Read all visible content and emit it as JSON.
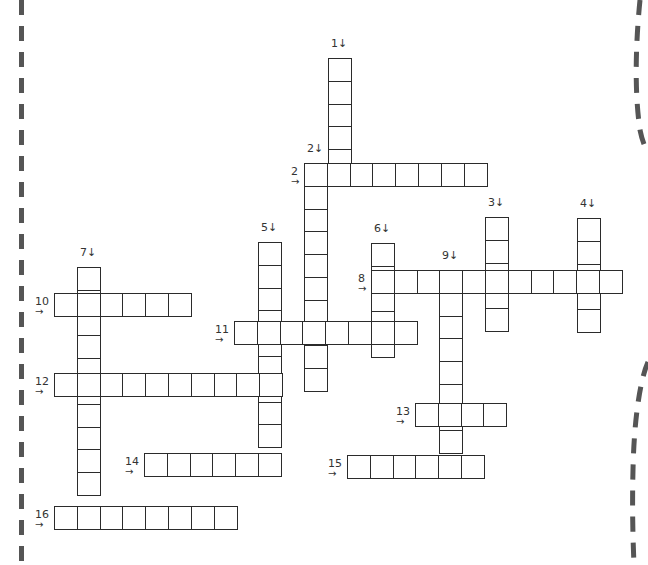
{
  "puzzle": {
    "cell_size": 22.8,
    "border_color": "#2b2b2b",
    "words": [
      {
        "num": "1",
        "dir": "down",
        "x": 328,
        "y": 58,
        "len": 5,
        "label": "1↓"
      },
      {
        "num": "2",
        "dir": "across",
        "x": 304,
        "y": 163,
        "len": 8,
        "label": "2",
        "arrow": "→"
      },
      {
        "num": "2",
        "dir": "down",
        "x": 304,
        "y": 163,
        "len": 10,
        "label": "2↓"
      },
      {
        "num": "3",
        "dir": "down",
        "x": 485,
        "y": 217,
        "len": 5,
        "label": "3↓"
      },
      {
        "num": "4",
        "dir": "down",
        "x": 577,
        "y": 218,
        "len": 5,
        "label": "4↓"
      },
      {
        "num": "5",
        "dir": "down",
        "x": 258,
        "y": 242,
        "len": 9,
        "label": "5↓"
      },
      {
        "num": "6",
        "dir": "down",
        "x": 371,
        "y": 243,
        "len": 5,
        "label": "6↓"
      },
      {
        "num": "7",
        "dir": "down",
        "x": 77,
        "y": 267,
        "len": 10,
        "label": "7↓"
      },
      {
        "num": "8",
        "dir": "across",
        "x": 371,
        "y": 270,
        "len": 11,
        "label": "8",
        "arrow": "→"
      },
      {
        "num": "9",
        "dir": "down",
        "x": 439,
        "y": 270,
        "len": 8,
        "label": "9↓"
      },
      {
        "num": "10",
        "dir": "across",
        "x": 54,
        "y": 293,
        "len": 6,
        "label": "10",
        "arrow": "→"
      },
      {
        "num": "11",
        "dir": "across",
        "x": 234,
        "y": 321,
        "len": 8,
        "label": "11",
        "arrow": "→"
      },
      {
        "num": "12",
        "dir": "across",
        "x": 54,
        "y": 373,
        "len": 10,
        "label": "12",
        "arrow": "→"
      },
      {
        "num": "13",
        "dir": "across",
        "x": 415,
        "y": 403,
        "len": 4,
        "label": "13",
        "arrow": "→"
      },
      {
        "num": "14",
        "dir": "across",
        "x": 144,
        "y": 453,
        "len": 6,
        "label": "14",
        "arrow": "→"
      },
      {
        "num": "15",
        "dir": "across",
        "x": 347,
        "y": 455,
        "len": 6,
        "label": "15",
        "arrow": "→"
      },
      {
        "num": "16",
        "dir": "across",
        "x": 54,
        "y": 506,
        "len": 8,
        "label": "16",
        "arrow": "→"
      }
    ]
  }
}
